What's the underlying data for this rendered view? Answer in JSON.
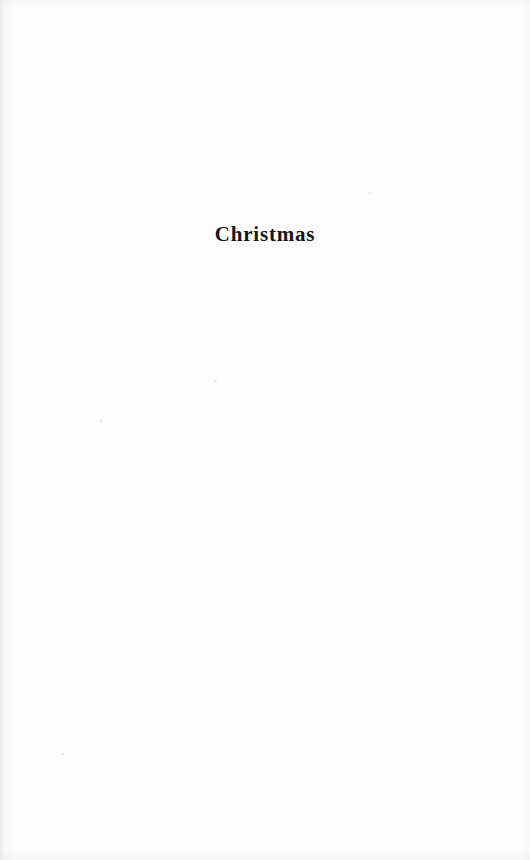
{
  "page": {
    "type": "scanned-book-page",
    "width": 530,
    "height": 860,
    "background_color": "#fdfdfd",
    "ink_color": "#16161a"
  },
  "content": {
    "title": "Christmas",
    "body_text": "",
    "page_number": ""
  },
  "artifacts": {
    "gutter_shadow_edge": "left",
    "noise_edges": [
      "top",
      "bottom",
      "right"
    ],
    "speck_count": 4
  }
}
